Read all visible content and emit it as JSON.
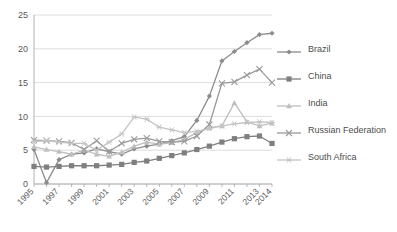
{
  "chart_data": {
    "type": "line",
    "title": "",
    "xlabel": "",
    "ylabel": "",
    "ylim": [
      0,
      25
    ],
    "ytick_step": 5,
    "yticks": [
      "0",
      "5",
      "10",
      "15",
      "20",
      "25"
    ],
    "grid": true,
    "legend_position": "right",
    "x": [
      1995,
      1996,
      1997,
      1998,
      1999,
      2000,
      2001,
      2002,
      2003,
      2004,
      2005,
      2006,
      2007,
      2008,
      2009,
      2010,
      2011,
      2012,
      2013,
      2014
    ],
    "xtick_labels": [
      "1995",
      "1997",
      "1999",
      "2001",
      "2003",
      "2005",
      "2007",
      "2009",
      "2011",
      "2013",
      "2014"
    ],
    "series": [
      {
        "name": "Brazil",
        "marker": "diamond",
        "color": "#8c8c8c",
        "values": [
          5.1,
          0.2,
          3.6,
          4.4,
          4.6,
          5.2,
          4.8,
          4.4,
          5.2,
          5.6,
          5.9,
          6.4,
          7.0,
          9.4,
          13.0,
          18.2,
          19.6,
          20.9,
          22.1,
          22.3
        ]
      },
      {
        "name": "China",
        "marker": "square",
        "color": "#7f7f7f",
        "values": [
          2.6,
          2.5,
          2.6,
          2.7,
          2.7,
          2.7,
          2.8,
          2.9,
          3.2,
          3.4,
          3.8,
          4.2,
          4.6,
          5.1,
          5.6,
          6.2,
          6.7,
          7.0,
          7.1,
          6.0
        ]
      },
      {
        "name": "India",
        "marker": "triangle",
        "color": "#bfbfbf",
        "values": [
          5.5,
          5.1,
          4.8,
          4.4,
          5.0,
          4.4,
          4.1,
          4.7,
          5.6,
          6.2,
          5.9,
          6.1,
          6.6,
          7.6,
          8.3,
          8.6,
          12.0,
          9.2,
          8.6,
          9.0
        ]
      },
      {
        "name": "Russian Federation",
        "marker": "cross",
        "color": "#9a9a9a",
        "values": [
          6.5,
          6.4,
          6.3,
          6.1,
          5.1,
          6.4,
          4.8,
          6.0,
          6.6,
          6.8,
          6.3,
          6.2,
          6.3,
          7.1,
          8.8,
          14.9,
          15.1,
          16.1,
          17.0,
          15.0
        ]
      },
      {
        "name": "South Africa",
        "marker": "asterisk",
        "color": "#c4c4c4",
        "values": [
          6.3,
          6.4,
          6.2,
          6.0,
          6.0,
          5.0,
          6.2,
          7.4,
          9.9,
          9.6,
          8.4,
          8.0,
          7.6,
          7.8,
          8.2,
          8.6,
          8.9,
          9.1,
          9.2,
          9.1
        ]
      }
    ]
  },
  "legend": {
    "items": [
      {
        "label": "Brazil"
      },
      {
        "label": "China"
      },
      {
        "label": "India"
      },
      {
        "label": "Russian Federation"
      },
      {
        "label": "South Africa"
      }
    ]
  }
}
